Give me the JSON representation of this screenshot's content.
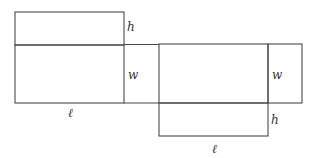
{
  "diagram": {
    "labels": {
      "left_h": "h",
      "left_w": "w",
      "left_l": "ℓ",
      "right_w": "w",
      "right_h": "h",
      "right_l": "ℓ"
    },
    "colors": {
      "stroke": "#4a4a4a",
      "text": "#333333",
      "background": "#ffffff"
    }
  }
}
